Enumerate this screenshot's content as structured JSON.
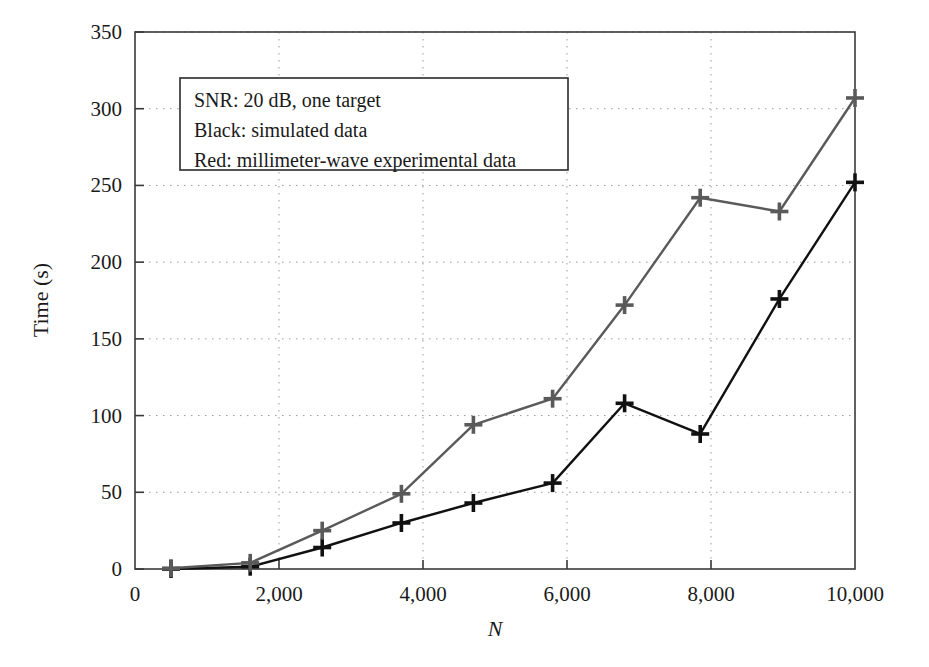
{
  "chart_data": {
    "type": "line",
    "title": "",
    "xlabel": "N",
    "ylabel": "Time (s)",
    "xlim": [
      0,
      10000
    ],
    "ylim": [
      0,
      350
    ],
    "grid": true,
    "grid_style": "dotted",
    "legend_position": "upper-left-inside",
    "x_ticks": [
      0,
      2000,
      4000,
      6000,
      8000,
      10000
    ],
    "x_tick_labels": [
      "0",
      "2,000",
      "4,000",
      "6,000",
      "8,000",
      "10,000"
    ],
    "y_ticks": [
      0,
      50,
      100,
      150,
      200,
      250,
      300,
      350
    ],
    "y_tick_labels": [
      "0",
      "50",
      "100",
      "150",
      "200",
      "250",
      "300",
      "350"
    ],
    "marker": "plus",
    "x": [
      500,
      1600,
      2600,
      3700,
      4700,
      5800,
      6800,
      7850,
      8950,
      10000
    ],
    "series": [
      {
        "name": "Black: simulated data",
        "color": "#111111",
        "values": [
          0,
          1.5,
          14,
          30,
          43,
          56,
          108,
          88,
          176,
          252
        ]
      },
      {
        "name": "Red: millimeter-wave experimental data",
        "color": "#5a5a5a",
        "values": [
          0.5,
          4,
          25,
          49,
          94,
          111,
          172,
          242,
          233,
          307
        ]
      }
    ],
    "annotations": [
      "SNR: 20 dB, one target",
      "Black: simulated data",
      "Red: millimeter-wave experimental data"
    ]
  },
  "legend_box": {
    "line1": "SNR: 20 dB, one target",
    "line2": "Black: simulated data",
    "line3": "Red: millimeter-wave experimental data"
  },
  "axes": {
    "y_title": "Time (s)",
    "x_title": "N"
  },
  "colors": {
    "simulated": "#111111",
    "experimental": "#5a5a5a",
    "axis": "#3a3a3a",
    "grid": "#9a9a9a",
    "background": "#ffffff"
  }
}
